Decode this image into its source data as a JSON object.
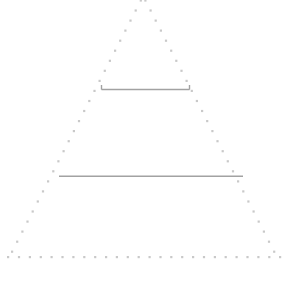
{
  "canvas": {
    "width": 287,
    "height": 289,
    "background_color": "#ffffff"
  },
  "diagram": {
    "type": "pyramid",
    "title": "",
    "dot_color": "#c9c9c9",
    "line_color": "#a2a2a2",
    "dot_size_px": 2,
    "dot_spacing_px": 11,
    "line_thickness_px": 1.5,
    "apex": {
      "x": 143,
      "y": -4
    },
    "base_left": {
      "x": 8,
      "y": 257
    },
    "base_right": {
      "x": 280,
      "y": 257
    },
    "outline_style": "dotted",
    "dividers": [
      {
        "name": "upper-divider",
        "y": 89,
        "x_start": 101,
        "x_end": 190,
        "has_end_ticks": true,
        "tick_height_px": 5,
        "style": "solid"
      },
      {
        "name": "lower-divider",
        "y": 176,
        "x_start": 59,
        "x_end": 243,
        "has_end_ticks": false,
        "tick_height_px": 0,
        "style": "solid"
      }
    ],
    "tiers": [
      {
        "name": "top-tier",
        "label": ""
      },
      {
        "name": "middle-tier",
        "label": ""
      },
      {
        "name": "bottom-tier",
        "label": ""
      }
    ]
  },
  "caption": {
    "text": "",
    "clipped": true,
    "note": ""
  }
}
